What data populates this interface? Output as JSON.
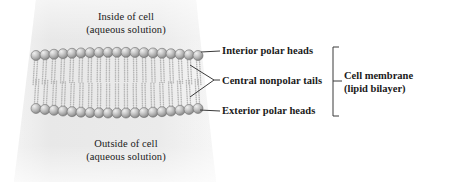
{
  "diagram": {
    "background_band_color": "#e9e9e9",
    "page_background": "#ffffff",
    "text_color": "#1a1a1a",
    "line_color": "#3a3a3a",
    "sphere_fill_light": "#d8d8d8",
    "sphere_fill_mid": "#a9a9a9",
    "sphere_fill_dark": "#8a8a8a",
    "sphere_stroke": "#6f6f6f",
    "tail_color": "#b4b4b4"
  },
  "captions": {
    "inside": {
      "line1": "Inside of cell",
      "line2": "(aqueous solution)"
    },
    "outside": {
      "line1": "Outside of cell",
      "line2": "(aqueous solution)"
    }
  },
  "annotations": [
    {
      "id": "interior-polar-heads",
      "label": "Interior polar heads"
    },
    {
      "id": "central-nonpolar-tails",
      "label": "Central nonpolar tails"
    },
    {
      "id": "exterior-polar-heads",
      "label": "Exterior polar heads"
    }
  ],
  "group_label": {
    "line1": "Cell membrane",
    "line2": "(lipid bilayer)"
  },
  "structure": {
    "head_count_top": 19,
    "head_count_bottom": 19,
    "head_diameter_px": 10,
    "tails_per_head": 2,
    "layers": 2,
    "tail_style": "beaded-dotted-chain"
  }
}
